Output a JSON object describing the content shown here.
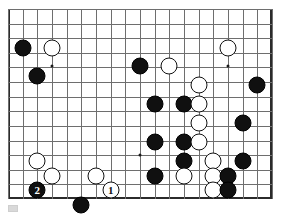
{
  "diagram": {
    "type": "go-board-diagram",
    "board": {
      "columns": 19,
      "visible_rows": 14,
      "origin_x": 8,
      "origin_y": 9,
      "cell_width": 14.67,
      "cell_height": 14.62,
      "line_color": "#6e6e6e",
      "strong_line_color": "#3a3a3a",
      "border_color": "#2b2b2b",
      "background": "#ffffff",
      "cropped_edges": [
        "top"
      ]
    },
    "star_points": [
      {
        "col": 3,
        "row": 3.9
      },
      {
        "col": 9,
        "row": 10
      },
      {
        "col": 15,
        "row": 3.9
      }
    ],
    "stones": [
      {
        "color": "black",
        "col": 1,
        "row": 2.65,
        "label": ""
      },
      {
        "color": "white",
        "col": 3,
        "row": 2.65,
        "label": ""
      },
      {
        "color": "black",
        "col": 2,
        "row": 4.6,
        "label": ""
      },
      {
        "color": "white",
        "col": 15,
        "row": 2.65,
        "label": ""
      },
      {
        "color": "black",
        "col": 9,
        "row": 3.9,
        "label": ""
      },
      {
        "color": "white",
        "col": 11,
        "row": 3.9,
        "label": ""
      },
      {
        "color": "white",
        "col": 13,
        "row": 5.2,
        "label": ""
      },
      {
        "color": "black",
        "col": 17,
        "row": 5.2,
        "label": ""
      },
      {
        "color": "black",
        "col": 10,
        "row": 6.5,
        "label": ""
      },
      {
        "color": "black",
        "col": 12,
        "row": 6.5,
        "label": ""
      },
      {
        "color": "white",
        "col": 13,
        "row": 6.5,
        "label": ""
      },
      {
        "color": "white",
        "col": 13,
        "row": 7.8,
        "label": ""
      },
      {
        "color": "black",
        "col": 16,
        "row": 7.8,
        "label": ""
      },
      {
        "color": "black",
        "col": 10,
        "row": 9.1,
        "label": ""
      },
      {
        "color": "black",
        "col": 12,
        "row": 9.1,
        "label": ""
      },
      {
        "color": "white",
        "col": 13,
        "row": 9.1,
        "label": ""
      },
      {
        "color": "white",
        "col": 2,
        "row": 10.4,
        "label": ""
      },
      {
        "color": "black",
        "col": 12,
        "row": 10.4,
        "label": ""
      },
      {
        "color": "white",
        "col": 14,
        "row": 10.4,
        "label": ""
      },
      {
        "color": "black",
        "col": 16,
        "row": 10.4,
        "label": ""
      },
      {
        "color": "white",
        "col": 3,
        "row": 11.4,
        "label": ""
      },
      {
        "color": "white",
        "col": 6,
        "row": 11.4,
        "label": ""
      },
      {
        "color": "black",
        "col": 10,
        "row": 11.4,
        "label": ""
      },
      {
        "color": "white",
        "col": 12,
        "row": 11.4,
        "label": ""
      },
      {
        "color": "white",
        "col": 14,
        "row": 11.4,
        "label": ""
      },
      {
        "color": "black",
        "col": 15,
        "row": 11.4,
        "label": ""
      },
      {
        "color": "black",
        "col": 2,
        "row": 12.4,
        "label": "2"
      },
      {
        "color": "white",
        "col": 7,
        "row": 12.4,
        "label": "1"
      },
      {
        "color": "white",
        "col": 14,
        "row": 12.4,
        "label": ""
      },
      {
        "color": "black",
        "col": 15,
        "row": 12.4,
        "label": ""
      },
      {
        "color": "black",
        "col": 5,
        "row": 13.4,
        "label": ""
      }
    ],
    "move_markers": [
      {
        "number": "1",
        "color": "white",
        "description": "white move one"
      },
      {
        "number": "2",
        "color": "black",
        "description": "black move two"
      }
    ],
    "caption_mark": {
      "present": true,
      "color": "#d9d9d9"
    }
  }
}
